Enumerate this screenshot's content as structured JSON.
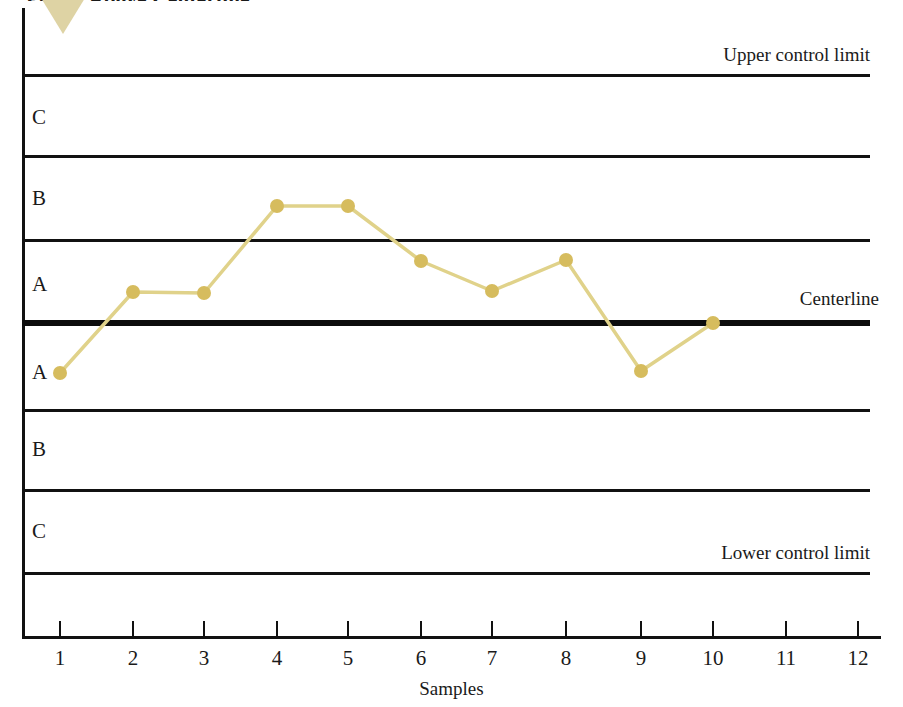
{
  "figure": {
    "caption": "Points Above Centerline",
    "caption_clipped": true
  },
  "colors": {
    "marker": "#d6bc5e",
    "line": "#e0d28a",
    "axis": "#111111",
    "centerline": "#0d0d0d",
    "arrow": "#ded3a4",
    "background": "#ffffff"
  },
  "annotations": {
    "upper_control_limit": "Upper control limit",
    "centerline": "Centerline",
    "lower_control_limit": "Lower control limit"
  },
  "zones": [
    {
      "label": "C",
      "position": "upper"
    },
    {
      "label": "B",
      "position": "upper"
    },
    {
      "label": "A",
      "position": "upper"
    },
    {
      "label": "A",
      "position": "lower"
    },
    {
      "label": "B",
      "position": "lower"
    },
    {
      "label": "C",
      "position": "lower"
    }
  ],
  "axis": {
    "x_title": "Samples",
    "x_ticks": [
      "1",
      "2",
      "3",
      "4",
      "5",
      "6",
      "7",
      "8",
      "9",
      "10",
      "11",
      "12"
    ]
  },
  "chart_data": {
    "type": "line",
    "title": "Points Above Centerline",
    "xlabel": "Samples",
    "ylabel": "",
    "grid": false,
    "legend": null,
    "x": [
      1,
      2,
      3,
      4,
      5,
      6,
      7,
      8,
      9,
      10
    ],
    "values": [
      -1.4,
      1.0,
      0.95,
      2.3,
      2.3,
      1.75,
      1.0,
      1.8,
      -1.35,
      0.0
    ],
    "value_units": "sigma zones from centerline",
    "ylim": [
      -3,
      3
    ],
    "zone_boundaries": [
      3,
      2,
      1,
      0,
      -1,
      -2,
      -3
    ],
    "zone_boundary_names": [
      "Upper control limit",
      "Zone C / Zone B boundary (upper)",
      "Zone B / Zone A boundary (upper)",
      "Centerline",
      "Zone A / Zone B boundary (lower)",
      "Zone B / Zone C boundary (lower)",
      "Lower control limit"
    ],
    "series": [
      {
        "name": "Sample measurements",
        "values": [
          -1.4,
          1.0,
          0.95,
          2.3,
          2.3,
          1.75,
          1.0,
          1.8,
          -1.35,
          0.0
        ]
      }
    ],
    "pixel_positions": {
      "note": "as rendered, x/y in screenshot pixels",
      "points": [
        {
          "sample": 1,
          "x": 60,
          "y": 373
        },
        {
          "sample": 2,
          "x": 133,
          "y": 292
        },
        {
          "sample": 3,
          "x": 204,
          "y": 293
        },
        {
          "sample": 4,
          "x": 277,
          "y": 206
        },
        {
          "sample": 5,
          "x": 348,
          "y": 206
        },
        {
          "sample": 6,
          "x": 421,
          "y": 261
        },
        {
          "sample": 7,
          "x": 492,
          "y": 291
        },
        {
          "sample": 8,
          "x": 566,
          "y": 260
        },
        {
          "sample": 9,
          "x": 641,
          "y": 371
        },
        {
          "sample": 10,
          "x": 713,
          "y": 323
        }
      ],
      "limit_lines_y": [
        76,
        156,
        240,
        410,
        490,
        573
      ],
      "centerline_y": 323,
      "x_tick_x": [
        60,
        133,
        204,
        277,
        348,
        421,
        492,
        566,
        641,
        713,
        786,
        858
      ]
    }
  }
}
